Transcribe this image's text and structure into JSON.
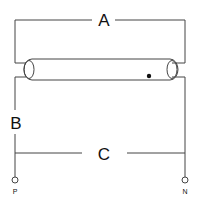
{
  "diagram": {
    "labels": {
      "top_wire": "A",
      "left_wire": "B",
      "bottom_wire": "C"
    },
    "terminals": {
      "left": "P",
      "right": "N"
    },
    "components": [
      "fluorescent-tube"
    ],
    "colors": {
      "line": "#333333",
      "background": "#ffffff"
    }
  }
}
